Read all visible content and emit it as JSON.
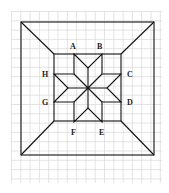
{
  "diagram": {
    "labels": {
      "A": "A",
      "B": "B",
      "C": "C",
      "D": "D",
      "E": "E",
      "F": "F",
      "G": "G",
      "H": "H"
    },
    "colors": {
      "grid": "#d8d8d8",
      "line": "#111111",
      "background": "#ffffff"
    }
  }
}
